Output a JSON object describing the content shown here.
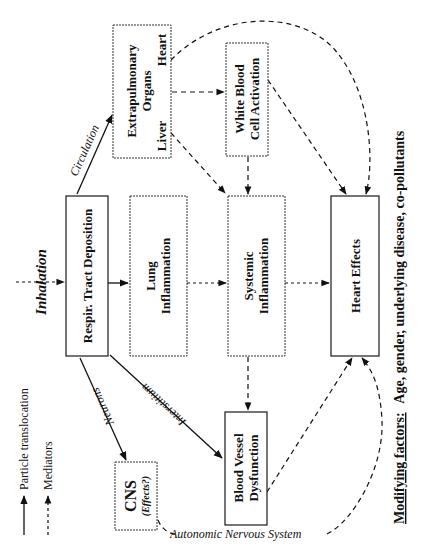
{
  "diagram": {
    "orientation": "rotated-90-ccw",
    "nodes": {
      "inhalation": "Inhalation",
      "respiratory_tract": "Respir. Tract Deposition",
      "extrapulmonary": {
        "title_line1": "Extrapulmonary",
        "title_line2": "Organs",
        "sub_top": "Heart",
        "sub_bottom": "Liver"
      },
      "white_blood": {
        "line1": "White Blood",
        "line2": "Cell Activation"
      },
      "lung_inflammation": {
        "line1": "Lung",
        "line2": "Inflammation"
      },
      "systemic_inflammation": {
        "line1": "Systemic",
        "line2": "Inflammation"
      },
      "heart_effects": "Heart Effects",
      "cns": {
        "title": "CNS",
        "subtitle": "(Effects?)"
      },
      "blood_vessel": {
        "line1": "Blood Vessel",
        "line2": "Dysfunction"
      }
    },
    "edge_labels": {
      "circulation": "Circulation",
      "neurons": "Neurons",
      "interstitium": "Interstitium",
      "autonomic": "Autonomic Nervous System"
    },
    "legend": {
      "solid": "Particle translocation",
      "dashed": "Mediators"
    },
    "modifying_factors": {
      "label": "Modifying factors:",
      "text": "Age, gender, underlying disease, co-pollutants"
    }
  }
}
